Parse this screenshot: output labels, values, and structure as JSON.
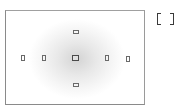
{
  "diagram": {
    "type": "viewfinder-af-points",
    "frame": {
      "stroke": "#8a8a8a",
      "vignette_center": "#d4d4d4"
    },
    "af_points": [
      {
        "id": "top",
        "orientation": "horizontal",
        "x": 73,
        "y": 30
      },
      {
        "id": "left-outer",
        "orientation": "vertical",
        "x": 21,
        "y": 55
      },
      {
        "id": "left-inner",
        "orientation": "vertical",
        "x": 42,
        "y": 55
      },
      {
        "id": "center",
        "orientation": "cross",
        "x": 72,
        "y": 55,
        "selected": true
      },
      {
        "id": "right-inner",
        "orientation": "vertical",
        "x": 105,
        "y": 55
      },
      {
        "id": "right-outer",
        "orientation": "vertical",
        "x": 126,
        "y": 56
      },
      {
        "id": "bottom",
        "orientation": "horizontal",
        "x": 73,
        "y": 83
      }
    ],
    "af_point_count": 7,
    "side_icon": "af-frame-bracket-icon"
  }
}
